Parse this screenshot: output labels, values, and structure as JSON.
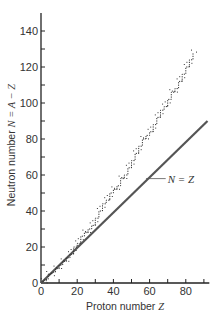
{
  "chart_data": {
    "type": "scatter",
    "title": "",
    "xlabel": "Proton number Z",
    "xlabel_prefix": "Proton number ",
    "xlabel_var": "Z",
    "ylabel": "Neutron number N = A − Z",
    "ylabel_prefix": "Neutron number ",
    "ylabel_var": "N = A − Z",
    "xlim": [
      0,
      93
    ],
    "ylim": [
      0,
      150
    ],
    "xticks": [
      0,
      20,
      40,
      60,
      80
    ],
    "xticks_minor_step": 10,
    "yticks": [
      0,
      20,
      40,
      60,
      80,
      100,
      120,
      140
    ],
    "yticks_minor_step": 10,
    "grid": false,
    "legend": "none",
    "annotations": [
      {
        "text": "N = Z",
        "x": 70,
        "y": 58,
        "points_to": [
          58,
          58
        ]
      }
    ],
    "series": [
      {
        "name": "Stable nuclei",
        "style": "dotted staircase band",
        "x": [
          1,
          2,
          4,
          6,
          8,
          10,
          12,
          14,
          16,
          18,
          20,
          22,
          24,
          26,
          28,
          30,
          32,
          34,
          36,
          38,
          40,
          42,
          44,
          46,
          48,
          50,
          52,
          54,
          56,
          58,
          60,
          62,
          64,
          66,
          68,
          70,
          72,
          74,
          76,
          78,
          80,
          82,
          84
        ],
        "y": [
          1,
          2,
          5,
          6,
          8,
          10,
          12,
          14,
          16,
          20,
          22,
          26,
          28,
          30,
          32,
          36,
          40,
          44,
          46,
          50,
          52,
          54,
          58,
          60,
          64,
          68,
          72,
          76,
          80,
          82,
          84,
          88,
          92,
          96,
          98,
          102,
          106,
          108,
          112,
          116,
          120,
          124,
          128
        ]
      },
      {
        "name": "N = Z",
        "style": "solid line",
        "x": [
          0,
          92
        ],
        "y": [
          0,
          90
        ]
      }
    ]
  }
}
